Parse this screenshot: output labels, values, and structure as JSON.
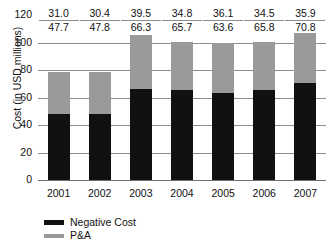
{
  "chart_data": {
    "type": "bar",
    "subtype": "stacked-bar",
    "title": "",
    "xlabel": "",
    "ylabel": "Cost (in USD millions)",
    "categories": [
      "2001",
      "2002",
      "2003",
      "2004",
      "2005",
      "2006",
      "2007"
    ],
    "series": [
      {
        "name": "Negative Cost",
        "color": "#111111",
        "values": [
          47.7,
          47.8,
          66.3,
          65.7,
          63.6,
          65.8,
          70.8
        ]
      },
      {
        "name": "P&A",
        "color": "#9a9a9a",
        "values": [
          31.0,
          30.4,
          39.5,
          34.8,
          36.1,
          34.5,
          35.9
        ]
      }
    ],
    "totals": [
      78.7,
      78.2,
      105.8,
      100.5,
      99.7,
      100.3,
      106.7
    ],
    "ylim": [
      0,
      120
    ],
    "yticks": [
      "0",
      "20",
      "40",
      "60",
      "80",
      "100",
      "120"
    ],
    "ytick_values": [
      0,
      20,
      40,
      60,
      80,
      100,
      120
    ],
    "grid": true,
    "legend_position": "bottom-left",
    "data_labels": [
      {
        "category": "2001",
        "pa": "31.0",
        "negative_cost": "47.7"
      },
      {
        "category": "2002",
        "pa": "30.4",
        "negative_cost": "47.8"
      },
      {
        "category": "2003",
        "pa": "39.5",
        "negative_cost": "66.3"
      },
      {
        "category": "2004",
        "pa": "34.8",
        "negative_cost": "65.7"
      },
      {
        "category": "2005",
        "pa": "36.1",
        "negative_cost": "63.6"
      },
      {
        "category": "2006",
        "pa": "34.5",
        "negative_cost": "65.8"
      },
      {
        "category": "2007",
        "pa": "35.9",
        "negative_cost": "70.8"
      }
    ]
  },
  "legend": {
    "items": [
      {
        "label": "Negative Cost",
        "color": "#111111"
      },
      {
        "label": "P&A",
        "color": "#9a9a9a"
      }
    ]
  },
  "axes": {
    "y_title": "Cost (in USD millions)"
  }
}
